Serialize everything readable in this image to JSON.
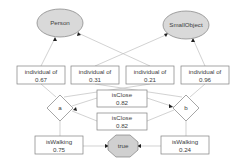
{
  "nodes": {
    "person": {
      "label": "Person"
    },
    "smallobject": {
      "label": "SmallObject"
    },
    "individual_of_1": {
      "label": "individual of",
      "value": "0.67"
    },
    "individual_of_2": {
      "label": "individual of",
      "value": "0.31"
    },
    "individual_of_3": {
      "label": "individual of",
      "value": "0.21"
    },
    "individual_of_4": {
      "label": "individual of",
      "value": "0.96"
    },
    "a": {
      "label": "a"
    },
    "b": {
      "label": "b"
    },
    "isclose_1": {
      "label": "isClose",
      "value": "0.82"
    },
    "isclose_2": {
      "label": "isClose",
      "value": "0.82"
    },
    "iswalking_a": {
      "label": "isWalking",
      "value": "0.75"
    },
    "iswalking_b": {
      "label": "isWalking",
      "value": "0.24"
    },
    "true": {
      "label": "true"
    }
  },
  "colors": {
    "class_fill": "#d9d9d9",
    "edge": "#bfbfbf",
    "border": "#7f7f7f",
    "text": "#404040"
  }
}
